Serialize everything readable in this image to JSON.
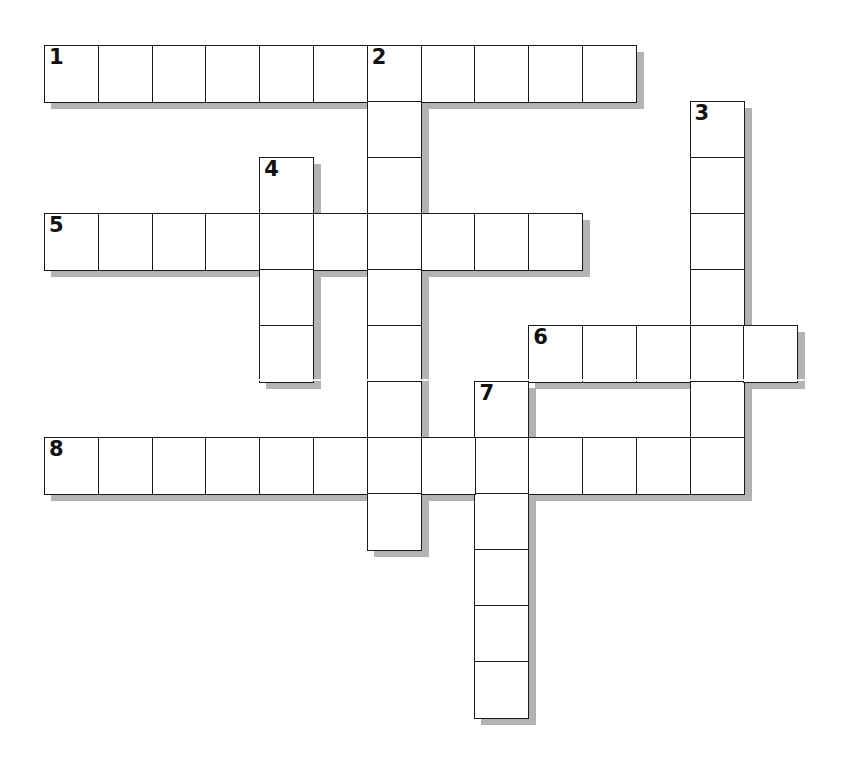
{
  "puzzle": {
    "type": "crossword",
    "grid_origin": {
      "x": 44,
      "y": 45
    },
    "cell_width": 53.8,
    "cell_height": 56,
    "colors": {
      "cell_bg": "#ffffff",
      "cell_border": "#1a1a1a",
      "shadow": "#b3b3b3",
      "number": "#111111"
    },
    "entries": [
      {
        "number": "1",
        "direction": "across",
        "row": 0,
        "col": 0,
        "length": 11
      },
      {
        "number": "2",
        "direction": "down",
        "row": 0,
        "col": 6,
        "length": 9
      },
      {
        "number": "3",
        "direction": "down",
        "row": 1,
        "col": 12,
        "length": 7
      },
      {
        "number": "4",
        "direction": "down",
        "row": 2,
        "col": 4,
        "length": 4
      },
      {
        "number": "5",
        "direction": "across",
        "row": 3,
        "col": 0,
        "length": 10
      },
      {
        "number": "6",
        "direction": "across",
        "row": 5,
        "col": 9,
        "length": 5
      },
      {
        "number": "7",
        "direction": "down",
        "row": 6,
        "col": 8,
        "length": 6
      },
      {
        "number": "8",
        "direction": "across",
        "row": 7,
        "col": 0,
        "length": 13
      }
    ]
  }
}
